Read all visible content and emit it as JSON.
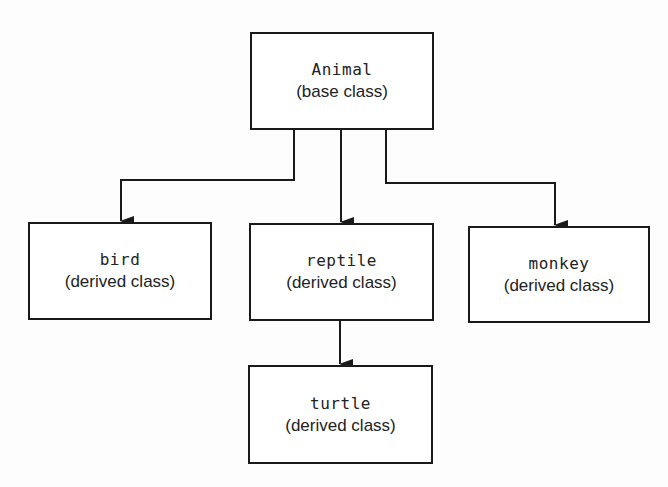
{
  "diagram": {
    "type": "class-hierarchy",
    "line_color": "#1a1a1a",
    "nodes": {
      "animal": {
        "name": "Animal",
        "kind": "(base class)"
      },
      "bird": {
        "name": "bird",
        "kind": "(derived class)"
      },
      "reptile": {
        "name": "reptile",
        "kind": "(derived class)"
      },
      "monkey": {
        "name": "monkey",
        "kind": "(derived class)"
      },
      "turtle": {
        "name": "turtle",
        "kind": "(derived class)"
      }
    },
    "edges": [
      {
        "from": "animal",
        "to": "bird"
      },
      {
        "from": "animal",
        "to": "reptile"
      },
      {
        "from": "animal",
        "to": "monkey"
      },
      {
        "from": "reptile",
        "to": "turtle"
      }
    ]
  }
}
